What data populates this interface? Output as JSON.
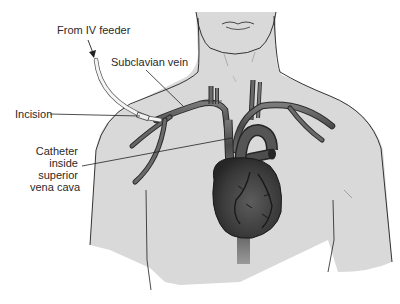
{
  "diagram": {
    "labels": {
      "iv_feeder": "From IV feeder",
      "subclavian_vein": "Subclavian vein",
      "incision": "Incision",
      "catheter_line1": "Catheter",
      "catheter_line2": "inside",
      "catheter_line3": "superior",
      "catheter_line4": "vena cava"
    },
    "colors": {
      "skin": "#d9d9d9",
      "outline": "#1e1e1e",
      "vein": "#5a5a5a",
      "heart": "#3c3c3c",
      "tube": "#f2f2f2",
      "background": "#ffffff"
    }
  }
}
